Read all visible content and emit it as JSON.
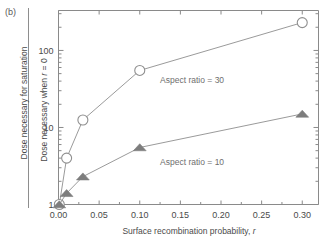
{
  "figure": {
    "panel_label": "(b)",
    "outer_ylabel": "Dose necessary for saturation",
    "inner_ylabel_prefix": "Dose necessary when ",
    "inner_ylabel_italic": "r",
    "inner_ylabel_suffix": " = 0",
    "xlabel_prefix": "Surface recombination probability, ",
    "xlabel_italic": "r",
    "line_color": "#8f8f8f",
    "axis_color": "#8a8a8a",
    "text_color": "#4a4a4a",
    "annotation_color": "#6f6f6f",
    "triangle_fill": "#7d7d7d",
    "circle_stroke": "#8f8f8f"
  },
  "chart_data": {
    "type": "line",
    "title": "",
    "xlabel": "Surface recombination probability, r",
    "ylabel": "Dose necessary when r = 0",
    "outer_ylabel": "Dose necessary for saturation",
    "panel": "(b)",
    "xscale": "linear",
    "yscale": "log",
    "xlim": [
      0.0,
      0.32
    ],
    "ylim": [
      1,
      330
    ],
    "xticks": [
      0.0,
      0.05,
      0.1,
      0.15,
      0.2,
      0.25,
      0.3
    ],
    "xticklabels": [
      "0.00",
      "0.05",
      "0.10",
      "0.15",
      "0.20",
      "0.25",
      "0.30"
    ],
    "yticks": [
      1,
      10,
      100
    ],
    "yticklabels": [
      "1",
      "10",
      "100"
    ],
    "grid": false,
    "legend": "inline-annotations",
    "series": [
      {
        "name": "Aspect ratio = 30",
        "marker": "open-circle",
        "annotation": "Aspect ratio = 30",
        "annotation_x": 0.125,
        "annotation_y": 38,
        "x": [
          0.001,
          0.01,
          0.03,
          0.1,
          0.3
        ],
        "y": [
          1.0,
          4.0,
          12.5,
          55.0,
          230.0
        ]
      },
      {
        "name": "Aspect ratio = 10",
        "marker": "filled-triangle",
        "annotation": "Aspect ratio = 10",
        "annotation_x": 0.125,
        "annotation_y": 3.3,
        "x": [
          0.001,
          0.01,
          0.03,
          0.1,
          0.3
        ],
        "y": [
          1.0,
          1.4,
          2.3,
          5.5,
          15.0
        ]
      }
    ]
  }
}
